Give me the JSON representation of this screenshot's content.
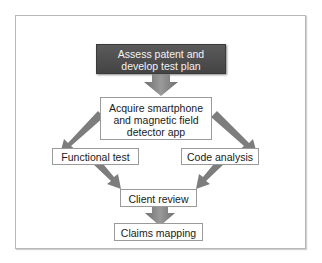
{
  "diagram": {
    "type": "flowchart",
    "colors": {
      "start_node_fill": "#4d4d4d",
      "start_node_text": "#f2f2f2",
      "node_fill": "#ffffff",
      "node_border": "#9a9a9a",
      "arrow": "#7a7a7a",
      "frame_border": "#b8b8b8"
    },
    "nodes": [
      {
        "id": "assess",
        "label_line1": "Assess patent and",
        "label_line2": "develop test plan"
      },
      {
        "id": "acquire",
        "label_line1": "Acquire smartphone",
        "label_line2": "and magnetic field",
        "label_line3": "detector app"
      },
      {
        "id": "functional",
        "label": "Functional test"
      },
      {
        "id": "code",
        "label": "Code analysis"
      },
      {
        "id": "review",
        "label": "Client review"
      },
      {
        "id": "claims",
        "label": "Claims mapping"
      }
    ],
    "edges": [
      {
        "from": "assess",
        "to": "acquire"
      },
      {
        "from": "acquire",
        "to": "functional"
      },
      {
        "from": "acquire",
        "to": "code"
      },
      {
        "from": "functional",
        "to": "review"
      },
      {
        "from": "code",
        "to": "review"
      },
      {
        "from": "review",
        "to": "claims"
      }
    ]
  }
}
